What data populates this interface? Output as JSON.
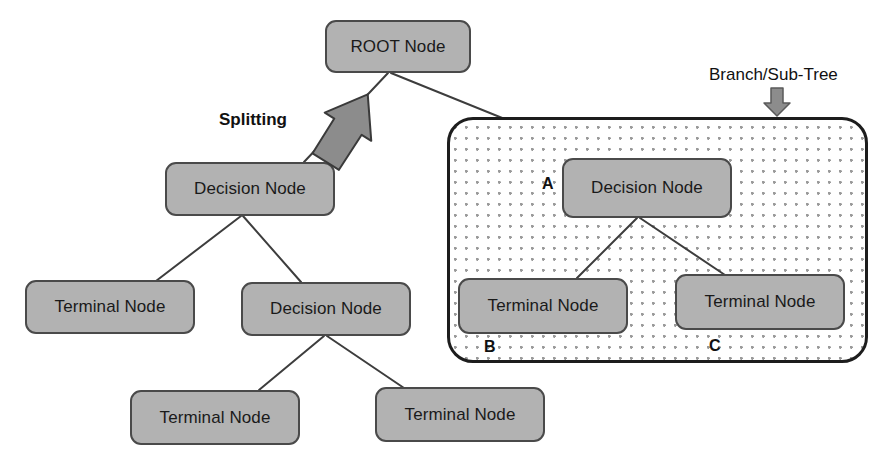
{
  "diagram": {
    "nodes": [
      {
        "id": "root",
        "label": "ROOT Node"
      },
      {
        "id": "dec-left",
        "label": "Decision Node"
      },
      {
        "id": "term-1",
        "label": "Terminal Node"
      },
      {
        "id": "dec-mid",
        "label": "Decision Node"
      },
      {
        "id": "term-2",
        "label": "Terminal Node"
      },
      {
        "id": "term-3",
        "label": "Terminal Node"
      },
      {
        "id": "dec-right",
        "label": "Decision Node"
      },
      {
        "id": "term-b",
        "label": "Terminal Node"
      },
      {
        "id": "term-c",
        "label": "Terminal Node"
      }
    ],
    "annotations": {
      "splitting": "Splitting",
      "branch": "Branch/Sub-Tree",
      "marker_a": "A",
      "marker_b": "B",
      "marker_c": "C"
    },
    "colors": {
      "node_fill": "#b2b2b2",
      "node_border": "#4a4a4a",
      "subtree_border": "#1d1d1d",
      "dot_pattern": "#9a9a9a",
      "arrow_fill": "#8c8c8c",
      "arrow_border": "#3a3a3a",
      "connector_line": "#3d3d3d",
      "text": "#1a1a1a",
      "background": "#ffffff"
    }
  }
}
